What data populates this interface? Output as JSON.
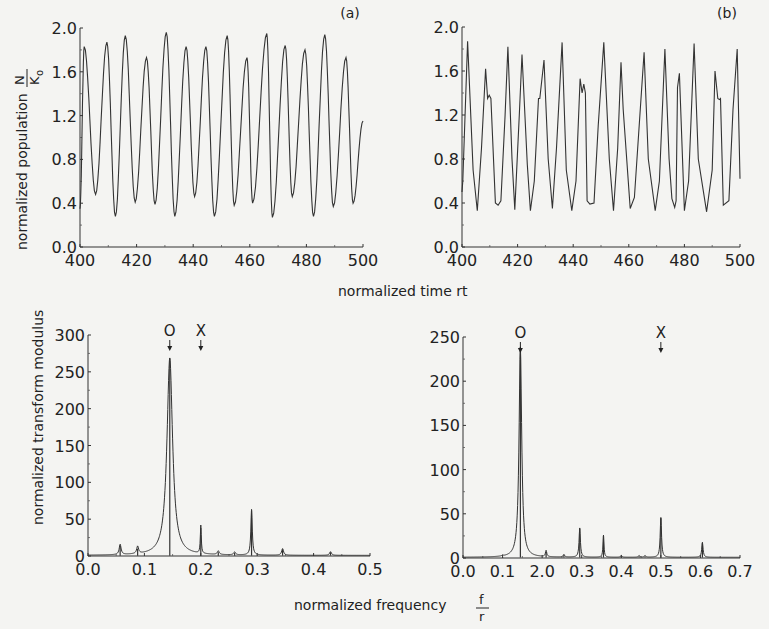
{
  "figure": {
    "top_xlabel": "normalized time rt",
    "top_ylabel": "normalized population",
    "top_ylabel_fraction": {
      "num": "N",
      "den": "K",
      "sub": "o"
    },
    "bottom_xlabel": "normalized frequency",
    "bottom_xlabel_fraction": {
      "num": "f",
      "den": "r"
    },
    "bottom_ylabel": "normalized transform modulus"
  },
  "chart_data": [
    {
      "id": "panel-a",
      "type": "line",
      "panel_label": "(a)",
      "title": "",
      "xlabel": "normalized time rt",
      "ylabel": "normalized population N/K0",
      "xlim": [
        400,
        500
      ],
      "ylim": [
        0.0,
        2.0
      ],
      "xticks": [
        "400",
        "420",
        "440",
        "460",
        "480",
        "500"
      ],
      "yticks": [
        "0.0",
        "0.4",
        "0.8",
        "1.2",
        "1.6",
        "2.0"
      ],
      "grid": false,
      "series": [
        {
          "name": "N/K0",
          "x": [
            400,
            401.5,
            405.5,
            409.5,
            412.5,
            416,
            419.5,
            423.5,
            426.5,
            430.5,
            433.5,
            437.5,
            440.5,
            444.5,
            447.5,
            452,
            454.5,
            459,
            461,
            466,
            468,
            472.5,
            475,
            479.5,
            482.5,
            486.5,
            489.5,
            494,
            496.5,
            500
          ],
          "y": [
            0.35,
            1.83,
            0.48,
            1.87,
            0.28,
            1.93,
            0.41,
            1.73,
            0.39,
            1.96,
            0.28,
            1.83,
            0.46,
            1.83,
            0.28,
            1.93,
            0.38,
            1.73,
            0.4,
            1.95,
            0.27,
            1.84,
            0.46,
            1.8,
            0.28,
            1.94,
            0.37,
            1.73,
            0.4,
            1.15
          ]
        }
      ]
    },
    {
      "id": "panel-b",
      "type": "line",
      "panel_label": "(b)",
      "title": "",
      "xlabel": "normalized time rt",
      "ylabel": "normalized population N/K0",
      "xlim": [
        400,
        500
      ],
      "ylim": [
        0.0,
        2.0
      ],
      "xticks": [
        "400",
        "420",
        "440",
        "460",
        "480",
        "500"
      ],
      "yticks": [
        "0.0",
        "0.4",
        "0.8",
        "1.2",
        "1.6",
        "2.0"
      ],
      "grid": false,
      "series": [
        {
          "name": "N/K0",
          "x": [
            400,
            400.3,
            402,
            404,
            405.5,
            407,
            408.5,
            409.2,
            409.8,
            410.4,
            412,
            413,
            414,
            415.5,
            416.5,
            418,
            419,
            420.6,
            421.6,
            423.5,
            424.6,
            426,
            427.5,
            428,
            429.5,
            431,
            432.5,
            434,
            436,
            437.5,
            439.5,
            441,
            442.5,
            443.2,
            443.8,
            444.4,
            445,
            446,
            447.5,
            449,
            451,
            453,
            454.5,
            456,
            457.2,
            458,
            460.5,
            462,
            464,
            465.5,
            467,
            469.5,
            471,
            473,
            474.5,
            475.5,
            476.5,
            477,
            477.5,
            478.2,
            480,
            481.5,
            483.5,
            485,
            488,
            490,
            491,
            492,
            492.6,
            493,
            494,
            496,
            497.5,
            499,
            500
          ],
          "y": [
            0.5,
            0.6,
            1.87,
            0.7,
            0.33,
            0.9,
            1.62,
            1.35,
            1.38,
            1.35,
            0.4,
            0.38,
            0.42,
            1.2,
            1.82,
            0.8,
            0.34,
            1.2,
            1.75,
            0.75,
            0.33,
            0.6,
            1.35,
            1.35,
            1.7,
            0.8,
            0.35,
            0.9,
            1.86,
            0.7,
            0.33,
            0.6,
            1.53,
            1.4,
            1.48,
            1.4,
            0.42,
            0.39,
            0.4,
            1.1,
            1.86,
            0.8,
            0.33,
            0.9,
            1.68,
            1.25,
            0.35,
            0.45,
            1.2,
            1.77,
            0.8,
            0.33,
            0.6,
            1.8,
            0.8,
            0.44,
            0.36,
            0.42,
            1.45,
            1.58,
            0.33,
            0.6,
            1.85,
            0.8,
            0.32,
            0.7,
            1.6,
            1.35,
            1.34,
            1.35,
            0.38,
            0.42,
            1.25,
            1.8,
            0.62
          ]
        }
      ]
    },
    {
      "id": "panel-c",
      "type": "line",
      "panel_label": "",
      "title": "",
      "xlabel": "normalized frequency f/r",
      "ylabel": "normalized transform modulus",
      "xlim": [
        0.0,
        0.5
      ],
      "ylim": [
        0,
        300
      ],
      "xticks": [
        "0.0",
        "0.1",
        "0.2",
        "0.3",
        "0.4",
        "0.5"
      ],
      "yticks": [
        "0",
        "50",
        "100",
        "150",
        "200",
        "250",
        "300"
      ],
      "grid": false,
      "annotations": [
        {
          "text": "O",
          "x": 0.145,
          "arrow": "down"
        },
        {
          "text": "X",
          "x": 0.2,
          "arrow": "down"
        }
      ],
      "series": [
        {
          "name": "spectral peaks",
          "peaks_x": [
            0.057,
            0.088,
            0.145,
            0.2,
            0.231,
            0.26,
            0.29,
            0.345,
            0.43
          ],
          "peaks_y": [
            14,
            10,
            268,
            38,
            5,
            4,
            62,
            9,
            5
          ],
          "peak_widths": [
            0.002,
            0.002,
            0.006,
            0.001,
            0.002,
            0.002,
            0.0015,
            0.002,
            0.002
          ]
        }
      ]
    },
    {
      "id": "panel-d",
      "type": "line",
      "panel_label": "",
      "title": "",
      "xlabel": "normalized frequency f/r",
      "ylabel": "normalized transform modulus",
      "xlim": [
        0.0,
        0.7
      ],
      "ylim": [
        0,
        250
      ],
      "xticks": [
        "0.0",
        "0.1",
        "2.0",
        "0.3",
        "0.4",
        "0.5",
        "0.6",
        "0.7"
      ],
      "yticks": [
        "0",
        "50",
        "100",
        "150",
        "200",
        "250"
      ],
      "grid": false,
      "annotations": [
        {
          "text": "O",
          "x": 0.145,
          "arrow": "down"
        },
        {
          "text": "X",
          "x": 0.5,
          "arrow": "down"
        }
      ],
      "series": [
        {
          "name": "spectral peaks",
          "peaks_x": [
            0.1,
            0.145,
            0.21,
            0.255,
            0.295,
            0.355,
            0.4,
            0.445,
            0.46,
            0.5,
            0.605
          ],
          "peaks_y": [
            1,
            238,
            7,
            3,
            33,
            25,
            2,
            2,
            2,
            45,
            17
          ],
          "peak_widths": [
            0.002,
            0.004,
            0.002,
            0.002,
            0.002,
            0.0015,
            0.002,
            0.002,
            0.002,
            0.002,
            0.002
          ]
        }
      ]
    }
  ],
  "layout": {
    "panels": [
      {
        "id": "panel-a",
        "x0": 80,
        "x1": 363,
        "y0": 247,
        "y1": 28,
        "label_x": 350,
        "label_y": 18
      },
      {
        "id": "panel-b",
        "x0": 462,
        "x1": 740,
        "y0": 247,
        "y1": 27,
        "label_x": 727,
        "label_y": 18
      },
      {
        "id": "panel-c",
        "x0": 88,
        "x1": 370,
        "y0": 556,
        "y1": 335
      },
      {
        "id": "panel-d",
        "x0": 463,
        "x1": 740,
        "y0": 558,
        "y1": 337
      }
    ]
  }
}
